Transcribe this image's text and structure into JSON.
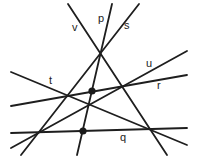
{
  "diagram": {
    "type": "line-arrangement",
    "colors": {
      "line": "#1e1e1e",
      "dot": "#1a1a1a",
      "background": "#ffffff",
      "label": "#222222"
    },
    "lines": [
      {
        "name": "v",
        "x1": 68,
        "y1": 4,
        "x2": 167,
        "y2": 155,
        "label": "v",
        "lx": 72,
        "ly": 31
      },
      {
        "name": "p",
        "x1": 112,
        "y1": 4,
        "x2": 77,
        "y2": 155,
        "label": "p",
        "lx": 98,
        "ly": 22
      },
      {
        "name": "s",
        "x1": 139,
        "y1": 4,
        "x2": 21,
        "y2": 155,
        "label": "s",
        "lx": 124,
        "ly": 29
      },
      {
        "name": "u",
        "x1": 187,
        "y1": 51,
        "x2": 11,
        "y2": 148,
        "label": "u",
        "lx": 146,
        "ly": 67
      },
      {
        "name": "r",
        "x1": 187,
        "y1": 75,
        "x2": 11,
        "y2": 106,
        "label": "r",
        "lx": 157,
        "ly": 89
      },
      {
        "name": "t",
        "x1": 11,
        "y1": 72,
        "x2": 187,
        "y2": 145,
        "label": "t",
        "lx": 49,
        "ly": 84
      },
      {
        "name": "q",
        "x1": 11,
        "y1": 133,
        "x2": 187,
        "y2": 128,
        "label": "q",
        "lx": 120,
        "ly": 141
      }
    ],
    "points": [
      {
        "name": "dot-upper",
        "cx": 92,
        "cy": 91,
        "r": 3.6
      },
      {
        "name": "dot-lower",
        "cx": 83,
        "cy": 131,
        "r": 3.6
      }
    ]
  }
}
